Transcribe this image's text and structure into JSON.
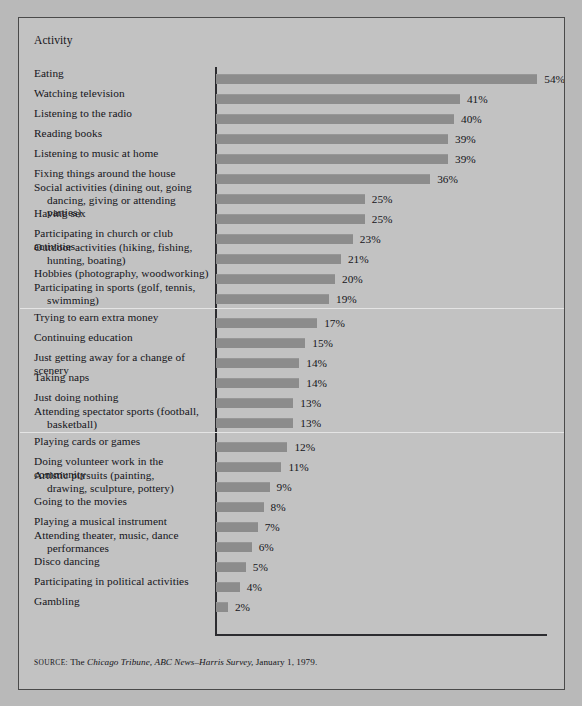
{
  "figure": {
    "column_header": "Activity",
    "source": {
      "label": "SOURCE:",
      "text_before": "The ",
      "italic_1": "Chicago Tribune,",
      "mid": " ",
      "italic_2": "ABC News–Harris Survey,",
      "text_after": " January 1, 1979."
    },
    "colors": {
      "page_background": "#b9b9b9",
      "panel_background": "#c2c2c2",
      "frame_border": "#4a4a4a",
      "bar_fill": "#8c8c8c",
      "axis": "#2c2c30",
      "separator": "#e4e4e4",
      "text": "#15151a"
    }
  },
  "chart_data": {
    "type": "bar",
    "orientation": "horizontal",
    "title": "",
    "xlabel": "",
    "ylabel": "Activity",
    "xlim": [
      0,
      55
    ],
    "grid": false,
    "legend": null,
    "value_suffix": "%",
    "categories": [
      "Eating",
      "Watching television",
      "Listening to the radio",
      "Reading books",
      "Listening to music at home",
      "Fixing things around the house",
      "Social activities (dining out, going dancing, giving or attending parties)",
      "Having sex",
      "Participating in church or club activities",
      "Outdoor activities (hiking, fishing, hunting, boating)",
      "Hobbies (photography, woodworking)",
      "Participating in sports (golf, tennis, swimming)",
      "Trying to earn extra money",
      "Continuing education",
      "Just getting away for a change of scenery",
      "Taking naps",
      "Just doing nothing",
      "Attending spectator sports (football, basketball)",
      "Playing cards or games",
      "Doing volunteer work in the community",
      "Artistic pursuits (painting, drawing, sculpture, pottery)",
      "Going to the movies",
      "Playing a musical instrument",
      "Attending theater, music, dance performances",
      "Disco dancing",
      "Participating in political activities",
      "Gambling"
    ],
    "values": [
      54,
      41,
      40,
      39,
      39,
      36,
      25,
      25,
      23,
      21,
      20,
      19,
      17,
      15,
      14,
      14,
      13,
      13,
      12,
      11,
      9,
      8,
      7,
      6,
      5,
      4,
      2
    ],
    "group_breaks_after": [
      11,
      17
    ]
  },
  "rows": [
    {
      "line1": "Eating",
      "line2": "",
      "value": 54,
      "value_label": "54%"
    },
    {
      "line1": "Watching television",
      "line2": "",
      "value": 41,
      "value_label": "41%"
    },
    {
      "line1": "Listening to the radio",
      "line2": "",
      "value": 40,
      "value_label": "40%"
    },
    {
      "line1": "Reading books",
      "line2": "",
      "value": 39,
      "value_label": "39%"
    },
    {
      "line1": "Listening to music at home",
      "line2": "",
      "value": 39,
      "value_label": "39%"
    },
    {
      "line1": "Fixing things around the house",
      "line2": "",
      "value": 36,
      "value_label": "36%"
    },
    {
      "line1": "Social activities (dining out, going",
      "line2": "dancing, giving or attending parties)",
      "value": 25,
      "value_label": "25%"
    },
    {
      "line1": "Having sex",
      "line2": "",
      "value": 25,
      "value_label": "25%"
    },
    {
      "line1": "Participating in church or club activities",
      "line2": "",
      "value": 23,
      "value_label": "23%"
    },
    {
      "line1": "Outdoor activities (hiking, fishing,",
      "line2": "hunting, boating)",
      "value": 21,
      "value_label": "21%"
    },
    {
      "line1": "Hobbies (photography, woodworking)",
      "line2": "",
      "value": 20,
      "value_label": "20%"
    },
    {
      "line1": "Participating in sports (golf, tennis,",
      "line2": "swimming)",
      "value": 19,
      "value_label": "19%"
    },
    {
      "line1": "Trying to earn extra money",
      "line2": "",
      "value": 17,
      "value_label": "17%"
    },
    {
      "line1": "Continuing education",
      "line2": "",
      "value": 15,
      "value_label": "15%"
    },
    {
      "line1": "Just getting away for a change of scenery",
      "line2": "",
      "value": 14,
      "value_label": "14%"
    },
    {
      "line1": "Taking naps",
      "line2": "",
      "value": 14,
      "value_label": "14%"
    },
    {
      "line1": "Just doing nothing",
      "line2": "",
      "value": 13,
      "value_label": "13%"
    },
    {
      "line1": "Attending spectator sports (football,",
      "line2": "basketball)",
      "value": 13,
      "value_label": "13%"
    },
    {
      "line1": "Playing cards or games",
      "line2": "",
      "value": 12,
      "value_label": "12%"
    },
    {
      "line1": "Doing volunteer work in the community",
      "line2": "",
      "value": 11,
      "value_label": "11%"
    },
    {
      "line1": "Artistic pursuits (painting,",
      "line2": "drawing, sculpture, pottery)",
      "value": 9,
      "value_label": "9%"
    },
    {
      "line1": "Going to the movies",
      "line2": "",
      "value": 8,
      "value_label": "8%"
    },
    {
      "line1": "Playing a musical instrument",
      "line2": "",
      "value": 7,
      "value_label": "7%"
    },
    {
      "line1": "Attending theater, music, dance",
      "line2": "performances",
      "value": 6,
      "value_label": "6%"
    },
    {
      "line1": "Disco dancing",
      "line2": "",
      "value": 5,
      "value_label": "5%"
    },
    {
      "line1": "Participating in political activities",
      "line2": "",
      "value": 4,
      "value_label": "4%"
    },
    {
      "line1": "Gambling",
      "line2": "",
      "value": 2,
      "value_label": "2%"
    }
  ]
}
